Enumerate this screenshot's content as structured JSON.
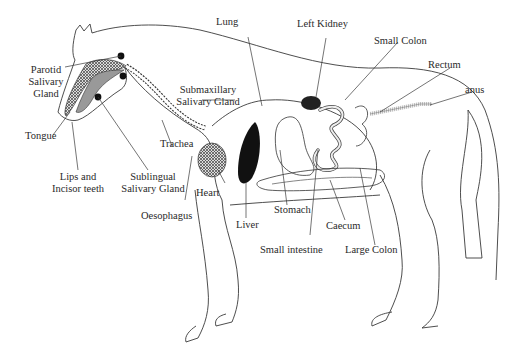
{
  "diagram": {
    "labels": {
      "lung": "Lung",
      "left_kidney": "Left Kidney",
      "small_colon": "Small Colon",
      "rectum": "Rectum",
      "anus": "anus",
      "parotid_line1": "Parotid",
      "parotid_line2": "Salivary",
      "parotid_line3": "Gland",
      "submax_line1": "Submaxillary",
      "submax_line2": "Salivary Gland",
      "tongue": "Tongue",
      "trachea": "Trachea",
      "lips_line1": "Lips and",
      "lips_line2": "Incisor teeth",
      "sublingual_line1": "Sublingual",
      "sublingual_line2": "Salivary Gland",
      "heart": "Heart",
      "oesophagus": "Oesophagus",
      "liver": "Liver",
      "stomach": "Stomach",
      "caecum": "Caecum",
      "small_intestine": "Small intestine",
      "large_colon": "Large Colon"
    },
    "colors": {
      "outline": "#3a3a3a",
      "organ_dark": "#111111",
      "organ_hatched": "#555555",
      "text": "#2a2a2a"
    }
  }
}
